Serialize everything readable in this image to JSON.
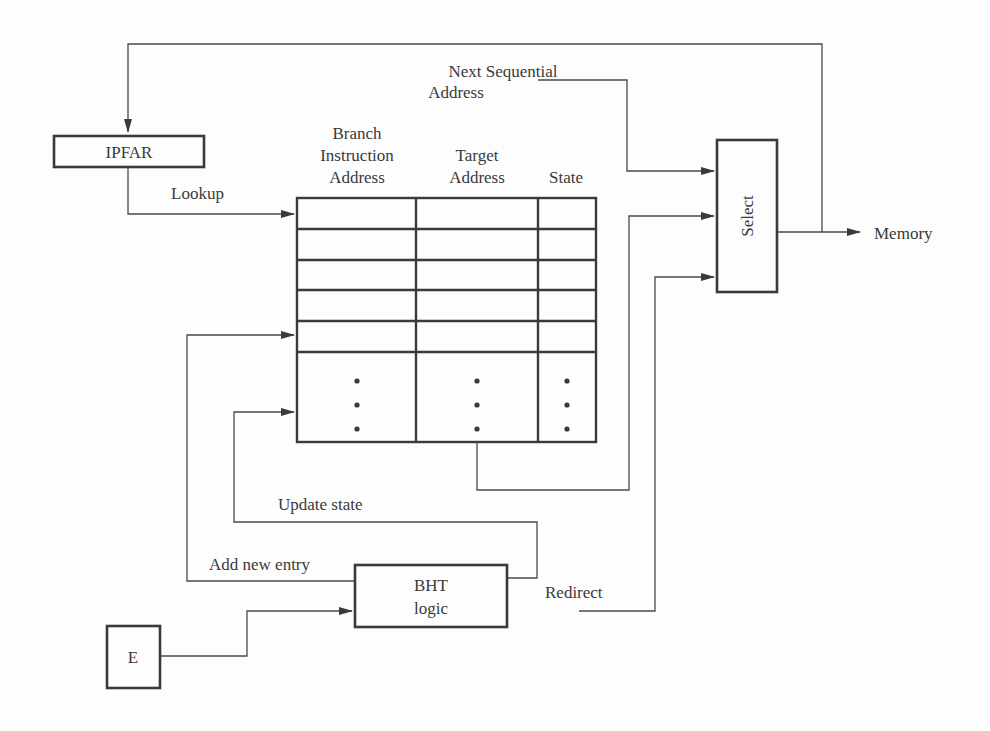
{
  "diagram": {
    "blocks": {
      "ipfar": "IPFAR",
      "select": "Select",
      "bht_line1": "BHT",
      "bht_line2": "logic",
      "e": "E"
    },
    "table": {
      "columns": [
        {
          "lines": [
            "Branch",
            "Instruction",
            "Address"
          ]
        },
        {
          "lines": [
            "Target",
            "Address"
          ]
        },
        {
          "lines": [
            "State"
          ]
        }
      ],
      "explicit_rows": 5,
      "ellipsis": "⋮"
    },
    "labels": {
      "next_seq_1": "Next Sequential",
      "next_seq_2": "Address",
      "lookup": "Lookup",
      "memory": "Memory",
      "update_state": "Update state",
      "add_new_entry": "Add new entry",
      "redirect": "Redirect"
    },
    "colors": {
      "stroke": "#3a3a3a",
      "background": "#fdfdfd"
    }
  }
}
